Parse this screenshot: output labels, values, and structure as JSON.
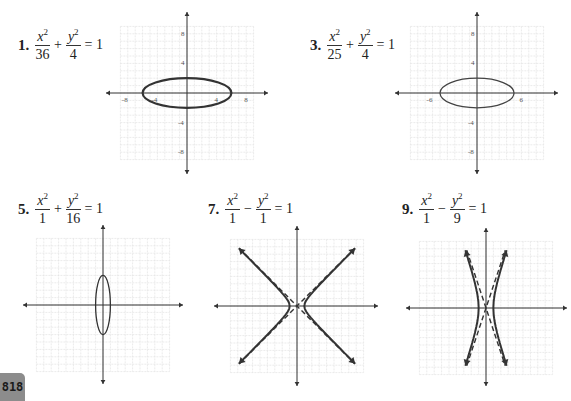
{
  "page": {
    "number": "818"
  },
  "problems": [
    {
      "label": "1.",
      "term1": {
        "num": "x",
        "exp": "2",
        "den": "36"
      },
      "op": "+",
      "term2": {
        "num": "y",
        "exp": "2",
        "den": "4"
      },
      "rhs": "= 1"
    },
    {
      "label": "3.",
      "term1": {
        "num": "x",
        "exp": "2",
        "den": "25"
      },
      "op": "+",
      "term2": {
        "num": "y",
        "exp": "2",
        "den": "4"
      },
      "rhs": "= 1"
    },
    {
      "label": "5.",
      "term1": {
        "num": "x",
        "exp": "2",
        "den": "1"
      },
      "op": "+",
      "term2": {
        "num": "y",
        "exp": "2",
        "den": "16"
      },
      "rhs": "= 1"
    },
    {
      "label": "7.",
      "term1": {
        "num": "x",
        "exp": "2",
        "den": "1"
      },
      "op": "−",
      "term2": {
        "num": "y",
        "exp": "2",
        "den": "1"
      },
      "rhs": "= 1"
    },
    {
      "label": "9.",
      "term1": {
        "num": "x",
        "exp": "2",
        "den": "1"
      },
      "op": "−",
      "term2": {
        "num": "y",
        "exp": "2",
        "den": "9"
      },
      "rhs": "= 1"
    }
  ],
  "graphs": [
    {
      "id": "graph-1",
      "type": "ellipse",
      "a": 6,
      "b": 2,
      "x_tick_labels": [
        "-8",
        "-4",
        "4",
        "8"
      ],
      "y_tick_labels": [
        "8",
        "4",
        "-4",
        "-8"
      ],
      "stroke": "#333333",
      "stroke_width": 2.2
    },
    {
      "id": "graph-3",
      "type": "ellipse",
      "a": 5,
      "b": 2,
      "x_tick_labels": [
        "-6",
        "6"
      ],
      "y_tick_labels": [
        "8",
        "4",
        "-4",
        "-8"
      ],
      "stroke": "#444444",
      "stroke_width": 1.3
    },
    {
      "id": "graph-5",
      "type": "ellipse",
      "a": 1,
      "b": 4,
      "x_tick_labels": [],
      "y_tick_labels": [],
      "stroke": "#333333",
      "stroke_width": 1.3
    },
    {
      "id": "graph-7",
      "type": "hyperbola",
      "a": 1,
      "b": 1,
      "asymptotes": "y = ±x",
      "stroke": "#333333",
      "stroke_width": 2
    },
    {
      "id": "graph-9",
      "type": "hyperbola",
      "a": 1,
      "b": 3,
      "asymptotes": "y = ±3x",
      "stroke": "#333333",
      "stroke_width": 2
    }
  ],
  "colors": {
    "grid": "#e2e2e2",
    "axis": "#333333",
    "badge_bg": "#8c8c8c"
  }
}
